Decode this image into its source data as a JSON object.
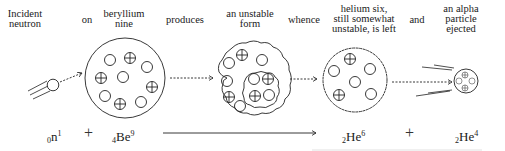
{
  "labels": {
    "incident_neutron": "Incident\nneutron",
    "on": "on",
    "beryllium_nine": "beryllium\nnine",
    "produces": "produces",
    "unstable_form": "an unstable\nform",
    "whence": "whence",
    "helium_six": "helium six,\nstill somewhat\nunstable, is left",
    "and": "and",
    "alpha_particle": "an alpha\nparticle\nejected"
  },
  "equation": {
    "neutron": {
      "pre": "0",
      "sym": "n",
      "sup": "1"
    },
    "plus1": "+",
    "beryllium": {
      "pre": "4",
      "sym": "Be",
      "sup": "9"
    },
    "helium6": {
      "pre": "2",
      "sym": "He",
      "sup": "6"
    },
    "plus2": "+",
    "helium4": {
      "pre": "2",
      "sym": "He",
      "sup": "4"
    }
  },
  "colors": {
    "ink": "#1a1a1a",
    "background": "#ffffff"
  }
}
